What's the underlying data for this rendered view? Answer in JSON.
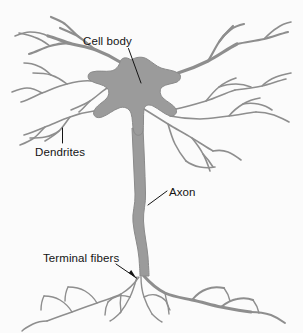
{
  "figure": {
    "background_color": "#fbfbfb",
    "cell_fill_color": "#9b9b9b",
    "cell_stroke_color": "#8e8e8e",
    "label_color": "#141414",
    "leader_color": "#141414"
  },
  "labels": {
    "cell_body": "Cell body",
    "dendrites": "Dendrites",
    "axon": "Axon",
    "terminal_fibers": "Terminal fibers"
  },
  "label_positions": {
    "cell_body": {
      "x": 83,
      "y": 45
    },
    "dendrites": {
      "x": 35,
      "y": 156
    },
    "axon": {
      "x": 169,
      "y": 196
    },
    "terminal_fibers": {
      "x": 43,
      "y": 262
    }
  },
  "leaders": {
    "cell_body": "M128.5,48.5 L141,83",
    "dendrites": "M62.5,128 L62.5,143",
    "axon": "M148,205 L167,191",
    "terminal_fibers": "M116,264 L136.5,278"
  },
  "arrowheads": {
    "terminal_fibers": "M136.5,278.5 L128.8,273.0 L131.2,270.0 Z"
  },
  "structure": {
    "soma": "M131,60 C136,57 142,56 147,59 C152,62 156,66 161,68 C167,70 173,70 178,73 C182,75 181,80 177,82 C172,84 166,84 162,87 C159,90 160,95 163,98 C167,102 173,104 176,109 C178,113 174,117 170,116 C164,114 159,109 153,106 C149,104 145,105 144,109 C143,116 144,124 143,131 C142,136 136,137 134,132 C132,126 133,119 131,113 C129,108 124,106 119,108 C113,110 108,115 102,117 C97,119 92,116 94,111 C96,106 102,103 106,99 C109,96 110,91 107,88 C103,84 96,84 91,81 C87,79 87,73 92,72 C98,70 105,72 111,71 C116,70 119,66 120,62 C121,58 126,56 131,60 Z",
    "axon_shaft": "M132,128 C133,150 134,172 135,194 C135.5,205 132,212 133,222 C134,234 138,246 139,258 C139.5,266 140,272 140,276 L149,276 C149,272 148.5,265 148,257 C147,245 144,233 143.5,221 C143,211 146,204 145.5,193 C145,171 144,149 143,128 Z",
    "dendrites_left": [
      "M120,62 C112,57 104,53 96,50 C88,47 80,46 72,44 C64,42 56,38 48,36",
      "M96,50 C90,46 85,41 79,37 C73,33 66,31 60,28",
      "M79,37 C74,33 70,28 65,24 C61,21 56,19 51,17",
      "M72,44 C64,42 57,44 50,46 C43,48 36,52 29,54",
      "M50,46 C45,42 40,39 34,37 C29,35 24,34 19,33",
      "M48,36 C42,33 36,32 30,32 C25,32 20,34 15,36",
      "M91,81 C83,80 75,82 67,84 C58,86 50,90 42,93 C35,96 28,100 21,102",
      "M67,84 C62,80 57,77 51,75 C45,73 39,73 33,73",
      "M51,75 C47,71 43,68 38,66 C34,64 29,63 24,63",
      "M42,93 C37,90 32,88 27,88 C22,88 17,90 12,92",
      "M94,111 C86,112 78,114 70,117 C61,120 53,124 45,127 C38,130 31,133 24,135",
      "M70,117 C66,122 63,127 59,131 C55,135 50,138 45,141",
      "M45,127 C41,131 38,135 34,138 C30,141 25,143 20,145",
      "M59,131 C55,134 50,136 45,137 C40,138 35,138 30,138",
      "M107,88 C101,92 96,97 90,101 C84,105 77,107 71,110",
      "M90,101 C86,105 83,109 79,112"
    ],
    "dendrites_right": [
      "M178,73 C188,70 198,66 208,61 C218,56 227,49 237,44",
      "M208,61 C212,55 215,48 219,42 C223,36 228,31 233,26",
      "M219,42 C222,37 226,33 230,30 C234,27 239,25 244,24",
      "M237,44 C246,42 255,41 264,39 C272,37 280,34 288,32",
      "M264,39 C268,35 272,31 277,28 C281,25 286,23 291,22",
      "M176,109 C186,107 196,104 206,101 C216,98 225,93 235,90",
      "M206,101 C210,96 214,91 219,87 C224,83 230,80 236,78",
      "M235,90 C244,89 253,88 262,86 C270,84 278,81 286,79",
      "M262,86 C266,82 271,79 276,77 C281,75 286,74 291,73",
      "M219,87 C224,85 230,84 236,84 C241,84 246,85 251,87",
      "M170,116 C180,118 190,119 200,119 C210,119 219,117 229,116 C238,115 247,113 256,112",
      "M229,116 C233,111 238,107 243,104 C248,101 254,99 260,98",
      "M256,112 C262,112 268,113 274,115 C279,117 284,119 289,122",
      "M243,104 C248,103 253,103 258,104 C263,105 268,107 272,110",
      "M144,109 C152,114 160,119 168,124 C176,129 184,133 192,138 C199,142 206,147 213,151",
      "M168,124 C170,131 172,138 175,144 C178,150 182,156 186,161",
      "M192,138 C196,143 200,148 203,154 C206,159 208,165 210,171",
      "M186,161 C190,164 195,166 200,167 C205,168 210,168 215,167",
      "M213,151 C218,150 223,150 228,152 C233,154 237,157 241,160",
      "M203,154 C207,158 210,162 213,167"
    ],
    "terminals": [
      "M144,276 C150,283 157,289 165,293 C174,297 183,298 192,300 C202,302 211,305 221,307 C231,309 241,311 251,312",
      "M192,300 C196,295 201,291 207,289 C212,287 218,287 224,288",
      "M221,307 C226,303 231,300 237,299 C242,298 248,298 253,300",
      "M251,312 C258,312 265,313 271,315 C276,317 281,320 285,323",
      "M224,288 C227,292 229,296 230,301",
      "M253,300 C256,304 258,308 259,313",
      "M165,293 C166,299 167,305 170,310",
      "M139,277 C134,284 128,290 121,294 C113,298 105,300 97,303 C88,306 80,309 72,312 C63,315 55,318 47,321",
      "M97,303 C94,298 90,294 85,291 C80,288 74,287 68,287",
      "M72,312 C69,307 65,303 60,300 C55,297 50,296 44,296",
      "M47,321 C42,321 37,322 33,324 C29,326 25,328 22,331",
      "M68,287 C66,291 65,296 65,301",
      "M44,296 C42,300 41,305 41,310",
      "M121,294 C120,300 120,306 121,312",
      "M141,277 C141,284 142,291 144,297 C146,303 149,309 152,314",
      "M144,297 C148,295 152,294 156,295 C160,296 163,298 166,301",
      "M137,277 C135,284 133,291 130,297 C127,303 124,308 120,313",
      "M130,297 C126,296 122,295 118,296 C114,297 111,299 108,302",
      "M152,314 C155,317 158,320 162,322",
      "M120,313 C117,316 114,319 110,321",
      "M108,302 C106,306 105,310 105,315",
      "M166,301 C168,305 169,309 169,314"
    ]
  },
  "stroke_widths": {
    "dendrite_primary": 3.2,
    "dendrite_secondary": 2.2,
    "dendrite_tertiary": 1.6,
    "terminal_primary": 3.0,
    "terminal_secondary": 2.0,
    "terminal_tertiary": 1.4
  }
}
